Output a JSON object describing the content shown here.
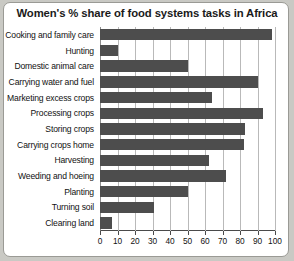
{
  "chart_data": {
    "type": "bar",
    "orientation": "horizontal",
    "title": "Women's % share of food systems tasks in Africa",
    "xlabel": "",
    "ylabel": "",
    "xlim": [
      0,
      100
    ],
    "xticks": [
      0,
      10,
      20,
      30,
      40,
      50,
      60,
      70,
      80,
      90,
      100
    ],
    "grid": "vertical",
    "legend": "none",
    "bar_color": "#4d4d4d",
    "categories": [
      "Cooking and family care",
      "Hunting",
      "Domestic animal care",
      "Carrying water and fuel",
      "Marketing excess crops",
      "Processing crops",
      "Storing crops",
      "Carrying crops home",
      "Harvesting",
      "Weeding and hoeing",
      "Planting",
      "Turning soil",
      "Clearing land"
    ],
    "values": [
      98,
      10,
      50,
      90,
      64,
      93,
      83,
      82,
      62,
      72,
      50,
      31,
      7
    ]
  }
}
